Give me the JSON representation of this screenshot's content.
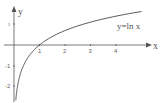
{
  "chart_data": {
    "type": "line",
    "title": "",
    "xlabel": "x",
    "ylabel": "y",
    "annotation": "y=ln x",
    "series": [
      {
        "name": "y=ln x",
        "x": [
          0.07,
          0.1,
          0.2,
          0.3,
          0.5,
          0.75,
          1,
          1.5,
          2,
          2.5,
          3,
          3.5,
          4,
          4.5,
          5
        ],
        "values": [
          -2.66,
          -2.3,
          -1.61,
          -1.2,
          -0.69,
          -0.29,
          0,
          0.41,
          0.69,
          0.92,
          1.1,
          1.25,
          1.39,
          1.5,
          1.61
        ]
      }
    ],
    "x_ticks": [
      "1",
      "2",
      "3",
      "4"
    ],
    "y_ticks": [
      "1",
      "-1",
      "-2"
    ],
    "xlim": [
      0,
      5.3
    ],
    "ylim": [
      -2.7,
      1.8
    ],
    "grid": false,
    "legend": "none"
  },
  "labels": {
    "x_axis": "x",
    "y_axis": "y",
    "function": "y=ln x",
    "x_tick_1": "1",
    "x_tick_2": "2",
    "x_tick_3": "3",
    "x_tick_4": "4",
    "y_tick_pos1": "1",
    "y_tick_neg1": "-1",
    "y_tick_neg2": "-2"
  },
  "colors": {
    "axis": "#555555",
    "curve": "#444444",
    "text": "#555555"
  }
}
